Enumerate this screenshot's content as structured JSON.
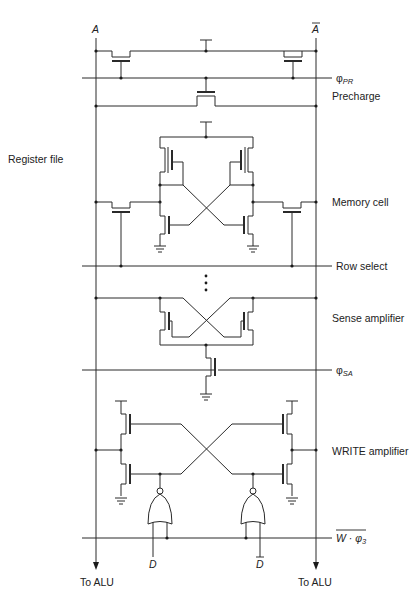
{
  "diagram": {
    "title": "Register file",
    "bitlines": {
      "left": "A",
      "right": "A",
      "right_overbar": true
    },
    "signals": {
      "precharge_clock": {
        "symbol": "φ",
        "subscript": "PR"
      },
      "row_select": "Row select",
      "sense_clock": {
        "symbol": "φ",
        "subscript": "SA"
      },
      "write_enable": {
        "text": "W · φ",
        "subscript": "3",
        "overbar": true
      }
    },
    "sections": {
      "precharge": "Precharge",
      "memory_cell": "Memory cell",
      "sense_amplifier": "Sense amplifier",
      "write_amplifier": "WRITE amplifier"
    },
    "inputs": {
      "data": "D",
      "data_bar": "D",
      "data_bar_overbar": true
    },
    "outputs": {
      "left": "To ALU",
      "right": "To ALU"
    },
    "ellipsis": "⋮"
  }
}
